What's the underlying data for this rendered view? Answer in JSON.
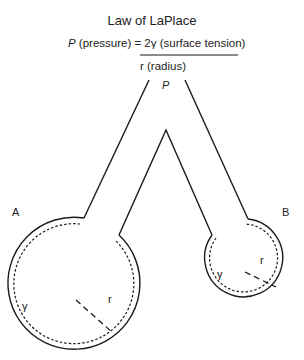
{
  "title": "Law of LaPlace",
  "equation": {
    "lhs_symbol": "P",
    "lhs_text": " (pressure) = 2γ (surface tension)",
    "denominator": "r (radius)"
  },
  "labels": {
    "pressure": "P",
    "bubble_a": "A",
    "bubble_b": "B",
    "gamma_a": "γ",
    "radius_a": "r",
    "gamma_b": "γ",
    "radius_b": "r"
  },
  "colors": {
    "line": "#1a1a1a",
    "background": "#ffffff"
  }
}
